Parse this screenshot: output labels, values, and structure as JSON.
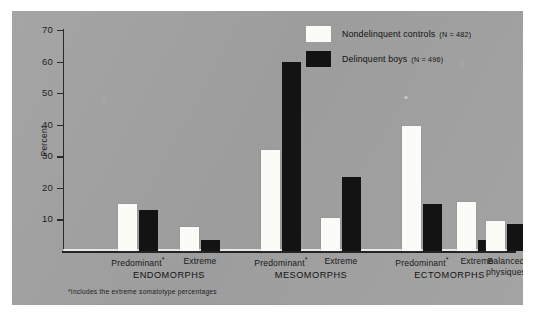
{
  "chart_data": {
    "type": "bar",
    "title": "",
    "subtitle": "",
    "xlabel": "",
    "ylabel": "Percent",
    "ylim": [
      0,
      70
    ],
    "ytick_labels": [
      "10",
      "20",
      "30",
      "40",
      "50",
      "60",
      "70"
    ],
    "ytick_values": [
      10,
      20,
      30,
      40,
      50,
      60,
      70
    ],
    "grid": false,
    "legend_position": "top-right",
    "categories": [
      "Predominant*",
      "Extreme",
      "Predominant*",
      "Extreme",
      "Predominant*",
      "Extreme",
      "Balanced physiques"
    ],
    "groups": [
      {
        "name": "ENDOMORPHS",
        "categories": [
          "Predominant*",
          "Extreme"
        ]
      },
      {
        "name": "MESOMORPHS",
        "categories": [
          "Predominant*",
          "Extreme"
        ]
      },
      {
        "name": "ECTOMORPHS",
        "categories": [
          "Predominant*",
          "Extreme"
        ]
      },
      {
        "name": "",
        "categories": [
          "Balanced physiques"
        ]
      }
    ],
    "series": [
      {
        "name": "Nondelinquent controls",
        "n_label": "(N = 482)",
        "color": "#fbfbf7",
        "values": [
          15,
          7.5,
          32,
          10.5,
          39.5,
          15.5,
          9.5
        ]
      },
      {
        "name": "Delinquent boys",
        "n_label": "(N = 496)",
        "color": "#131313",
        "values": [
          13,
          3.5,
          60,
          23.5,
          15,
          3.5,
          8.5
        ]
      }
    ],
    "annotations": [
      "*Includes the extreme somatotype percentages"
    ]
  },
  "axis": {
    "y_label": "Percent",
    "y_ticks": [
      "70",
      "60",
      "50",
      "40",
      "30",
      "20",
      "10"
    ]
  },
  "legend": {
    "items": [
      {
        "label": "Nondelinquent controls",
        "n": "(N = 482)",
        "swatch": "light"
      },
      {
        "label": "Delinquent boys",
        "n": "(N = 496)",
        "swatch": "dark"
      }
    ]
  },
  "xaxis": {
    "ticks": [
      {
        "line1": "Predominant",
        "star": "*"
      },
      {
        "line1": "Extreme",
        "star": ""
      },
      {
        "line1": "Predominant",
        "star": "*"
      },
      {
        "line1": "Extreme",
        "star": ""
      },
      {
        "line1": "Predominant",
        "star": "*"
      },
      {
        "line1": "Extreme",
        "star": ""
      },
      {
        "line1": "Balanced",
        "line2": "physiques",
        "star": ""
      }
    ],
    "groups": [
      "ENDOMORPHS",
      "MESOMORPHS",
      "ECTOMORPHS"
    ]
  },
  "footnote": "*Includes the extreme somatotype percentages",
  "colors": {
    "plate": "#a3a3a3",
    "light_bar": "#fbfbf7",
    "dark_bar": "#131313",
    "axis": "#2b2b2b",
    "text": "#141414",
    "page": "#ffffff"
  }
}
